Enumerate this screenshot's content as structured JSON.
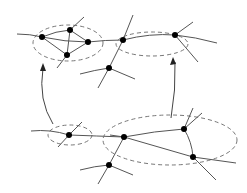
{
  "diagram": {
    "colors": {
      "edge": "#555555",
      "node": "#000000",
      "cluster": "#777777"
    },
    "top_graph": {
      "clusters": 2,
      "nodes": 7
    },
    "bottom_graph": {
      "clusters": 2,
      "nodes": 6
    },
    "arrows": 2
  }
}
